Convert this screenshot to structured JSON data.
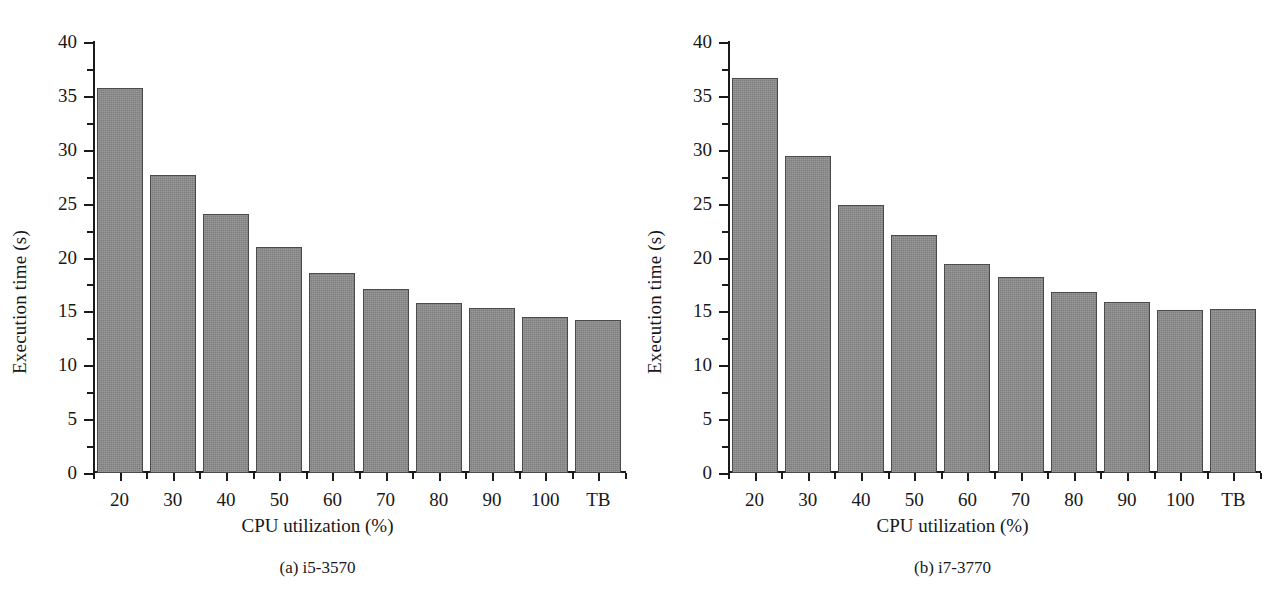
{
  "figure": {
    "panel_count": 2
  },
  "chart_data": [
    {
      "type": "bar",
      "title": "",
      "caption": "(a)  i5-3570",
      "xlabel": "CPU utilization (%)",
      "ylabel": "Execution time (s)",
      "categories": [
        "20",
        "30",
        "40",
        "50",
        "60",
        "70",
        "80",
        "90",
        "100",
        "TB"
      ],
      "values": [
        35.7,
        27.7,
        24.0,
        21.0,
        18.6,
        17.1,
        15.8,
        15.3,
        14.5,
        14.2
      ],
      "ylim": [
        0,
        40
      ],
      "ytick_labels": [
        "0",
        "5",
        "10",
        "15",
        "20",
        "25",
        "30",
        "35",
        "40"
      ],
      "ytick_values": [
        0,
        5,
        10,
        15,
        20,
        25,
        30,
        35,
        40
      ],
      "yminor_values": [
        2.5,
        7.5,
        12.5,
        17.5,
        22.5,
        27.5,
        32.5,
        37.5
      ],
      "grid": false,
      "legend": "none",
      "bar_color": "#8d8d8d",
      "bar_edge_color": "#4a4a4a"
    },
    {
      "type": "bar",
      "title": "",
      "caption": "(b)  i7-3770",
      "xlabel": "CPU utilization (%)",
      "ylabel": "Execution time (s)",
      "categories": [
        "20",
        "30",
        "40",
        "50",
        "60",
        "70",
        "80",
        "90",
        "100",
        "TB"
      ],
      "values": [
        36.7,
        29.4,
        24.9,
        22.1,
        19.4,
        18.2,
        16.8,
        15.9,
        15.1,
        15.2
      ],
      "ylim": [
        0,
        40
      ],
      "ytick_labels": [
        "0",
        "5",
        "10",
        "15",
        "20",
        "25",
        "30",
        "35",
        "40"
      ],
      "ytick_values": [
        0,
        5,
        10,
        15,
        20,
        25,
        30,
        35,
        40
      ],
      "yminor_values": [
        2.5,
        7.5,
        12.5,
        17.5,
        22.5,
        27.5,
        32.5,
        37.5
      ],
      "grid": false,
      "legend": "none",
      "bar_color": "#8d8d8d",
      "bar_edge_color": "#4a4a4a"
    }
  ]
}
